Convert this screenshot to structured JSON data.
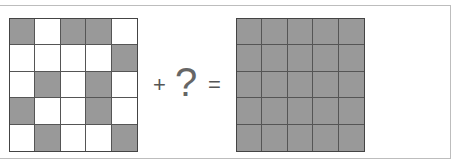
{
  "puzzle": {
    "left_grid": {
      "rows": 5,
      "cols": 5,
      "cells": [
        [
          1,
          0,
          1,
          1,
          0
        ],
        [
          0,
          0,
          0,
          0,
          1
        ],
        [
          0,
          1,
          0,
          1,
          0
        ],
        [
          1,
          0,
          0,
          1,
          0
        ],
        [
          0,
          1,
          0,
          0,
          1
        ]
      ]
    },
    "operator_plus": "+",
    "unknown": "?",
    "operator_equals": "=",
    "right_grid": {
      "rows": 5,
      "cols": 5,
      "cells": [
        [
          1,
          1,
          1,
          1,
          1
        ],
        [
          1,
          1,
          1,
          1,
          1
        ],
        [
          1,
          1,
          1,
          1,
          1
        ],
        [
          1,
          1,
          1,
          1,
          1
        ],
        [
          1,
          1,
          1,
          1,
          1
        ]
      ]
    },
    "colors": {
      "filled": "#999999",
      "empty": "#ffffff",
      "line": "#555555"
    }
  }
}
